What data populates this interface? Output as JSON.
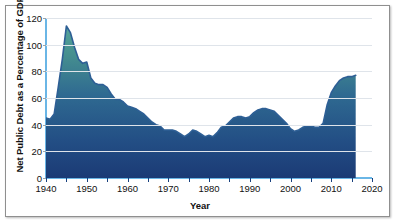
{
  "chart_data": {
    "type": "area",
    "title": "",
    "xlabel": "Year",
    "ylabel": "Net Public Debt as a Percentage of GDP",
    "xlim": [
      1940,
      2020
    ],
    "ylim": [
      0,
      120
    ],
    "xticks": [
      1940,
      1945,
      1950,
      1955,
      1960,
      1965,
      1970,
      1975,
      1980,
      1985,
      1990,
      1995,
      2000,
      2005,
      2010,
      2015,
      2020
    ],
    "xticklabels": [
      "1940",
      "1950",
      "1960",
      "1970",
      "1980",
      "1990",
      "2000",
      "2010",
      "2020"
    ],
    "xticklabel_values": [
      1940,
      1950,
      1960,
      1970,
      1980,
      1990,
      2000,
      2010,
      2020
    ],
    "yticks": [
      0,
      20,
      40,
      60,
      80,
      100,
      120
    ],
    "yticklabels": [
      "0",
      "20",
      "40",
      "60",
      "80",
      "100",
      "120"
    ],
    "grid": "horizontal",
    "legend": "none",
    "series_name": "Net Public Debt as a Percentage of GDP",
    "x": [
      1940,
      1941,
      1942,
      1943,
      1944,
      1945,
      1946,
      1947,
      1948,
      1949,
      1950,
      1951,
      1952,
      1953,
      1954,
      1955,
      1956,
      1957,
      1958,
      1959,
      1960,
      1961,
      1962,
      1963,
      1964,
      1965,
      1966,
      1967,
      1968,
      1969,
      1970,
      1971,
      1972,
      1973,
      1974,
      1975,
      1976,
      1977,
      1978,
      1979,
      1980,
      1981,
      1982,
      1983,
      1984,
      1985,
      1986,
      1987,
      1988,
      1989,
      1990,
      1991,
      1992,
      1993,
      1994,
      1995,
      1996,
      1997,
      1998,
      1999,
      2000,
      2001,
      2002,
      2003,
      2004,
      2005,
      2006,
      2007,
      2008,
      2009,
      2010,
      2011,
      2012,
      2013,
      2014,
      2015,
      2016
    ],
    "values": [
      45,
      44,
      48,
      68,
      89,
      114,
      109,
      98,
      89,
      86,
      87,
      75,
      71,
      70,
      70,
      68,
      63,
      59,
      59,
      57,
      54,
      53,
      52,
      50,
      48,
      45,
      42,
      40,
      39,
      36,
      36,
      36,
      35,
      33,
      31,
      33,
      36,
      35,
      33,
      31,
      32,
      31,
      34,
      38,
      39,
      42,
      45,
      46,
      46,
      45,
      46,
      49,
      51,
      52,
      52,
      51,
      50,
      47,
      44,
      41,
      37,
      35,
      36,
      38,
      39,
      39,
      38,
      38,
      41,
      55,
      64,
      69,
      73,
      75,
      76,
      76,
      77
    ],
    "annotations": [
      {
        "label": "WWII peak",
        "x": 1945,
        "y": 114
      },
      {
        "label": "postwar trough",
        "x": 1974,
        "y": 31
      },
      {
        "label": "mid-1990s peak",
        "x": 1993,
        "y": 52
      },
      {
        "label": "post-2008 rise",
        "x": 2016,
        "y": 77
      }
    ],
    "colors": {
      "area_top": "#4f9e96",
      "area_bottom": "#1d3d7a",
      "line": "#2e5f95",
      "axis": "#6ab6e6",
      "grid": "#dfe4ea",
      "text": "#111111"
    }
  }
}
